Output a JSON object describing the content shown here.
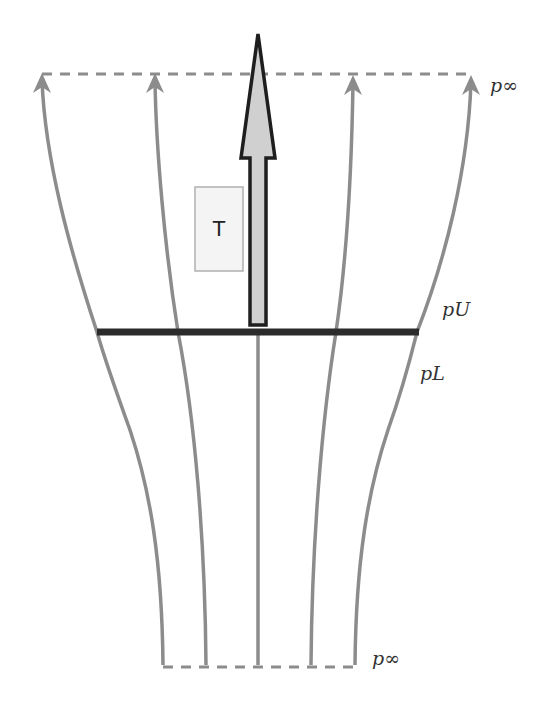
{
  "diagram": {
    "type": "actuator-disk-streamtube",
    "labels": {
      "p_inf_top": "p∞",
      "p_upper": "pU",
      "p_lower": "pL",
      "p_inf_bottom": "p∞",
      "thrust": "T"
    },
    "colors": {
      "streamline": "#8c8c8c",
      "disk": "#2b2b2b",
      "arrow_fill": "#d0d0d0",
      "arrow_stroke": "#1e1e1e",
      "thrust_box_fill": "#f4f4f4",
      "thrust_box_stroke": "#b0b0b0",
      "dashed": "#8c8c8c"
    },
    "geometry": {
      "top_boundary_y": 74,
      "disk_y": 332,
      "bottom_boundary_y": 667,
      "disk_x": [
        97,
        419
      ],
      "streamlines_top_x": [
        42,
        155,
        258,
        352,
        470
      ],
      "streamlines_disk_x": [
        97,
        178,
        258,
        336,
        417
      ],
      "streamlines_bottom_x": [
        163,
        206,
        258,
        311,
        355
      ]
    }
  }
}
